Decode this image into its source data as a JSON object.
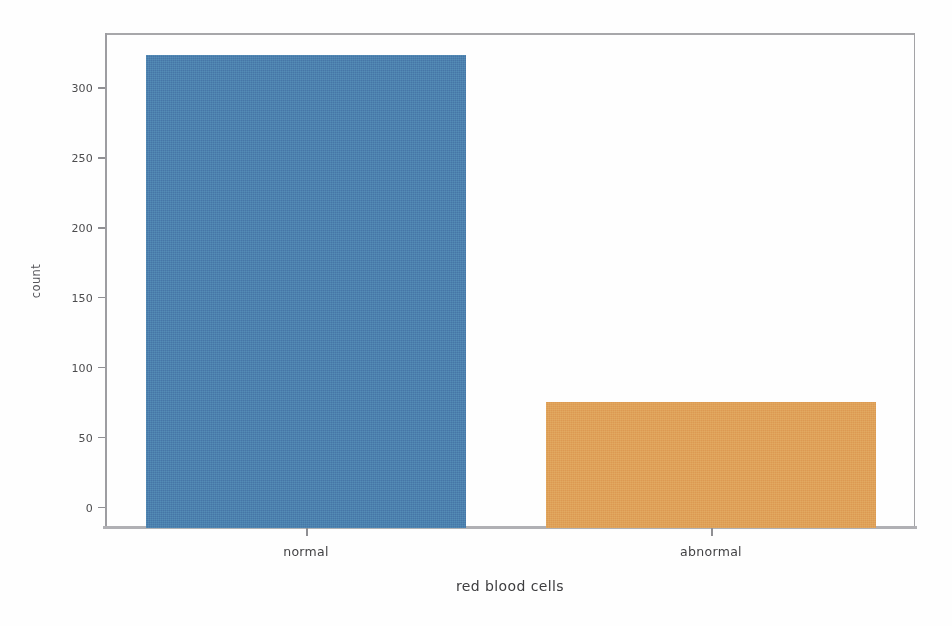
{
  "chart_data": {
    "type": "bar",
    "title": "",
    "xlabel": "red blood cells",
    "ylabel": "count",
    "categories": [
      "normal",
      "abnormal"
    ],
    "values": [
      324,
      76
    ],
    "series": [
      {
        "name": "count",
        "values": [
          324,
          76
        ]
      }
    ],
    "ylim": [
      0,
      340
    ],
    "yticks": [
      0,
      50,
      100,
      150,
      200,
      250,
      300
    ],
    "ytick_labels": [
      "0",
      "50",
      "100",
      "150",
      "200",
      "250",
      "300"
    ],
    "xtick_labels": [
      "normal",
      "abnormal"
    ],
    "grid": false,
    "legend": false,
    "legend_position": "none",
    "bar_colors": [
      "#4a7fae",
      "#e0a057"
    ],
    "background": "#ffffff",
    "axis_color": "#9a9a9a"
  },
  "axis": {
    "y_label": "count",
    "x_label": "red blood cells",
    "y_ticks": [
      {
        "label": "300",
        "value": 300
      },
      {
        "label": "250",
        "value": 250
      },
      {
        "label": "200",
        "value": 200
      },
      {
        "label": "150",
        "value": 150
      },
      {
        "label": "100",
        "value": 100
      },
      {
        "label": "50",
        "value": 50
      },
      {
        "label": "0",
        "value": 0
      }
    ],
    "x_ticks": [
      {
        "label": "normal"
      },
      {
        "label": "abnormal"
      }
    ]
  },
  "bars": [
    {
      "label": "normal",
      "value": 324,
      "color": "#4a7fae"
    },
    {
      "label": "abnormal",
      "value": 76,
      "color": "#e0a057"
    }
  ]
}
